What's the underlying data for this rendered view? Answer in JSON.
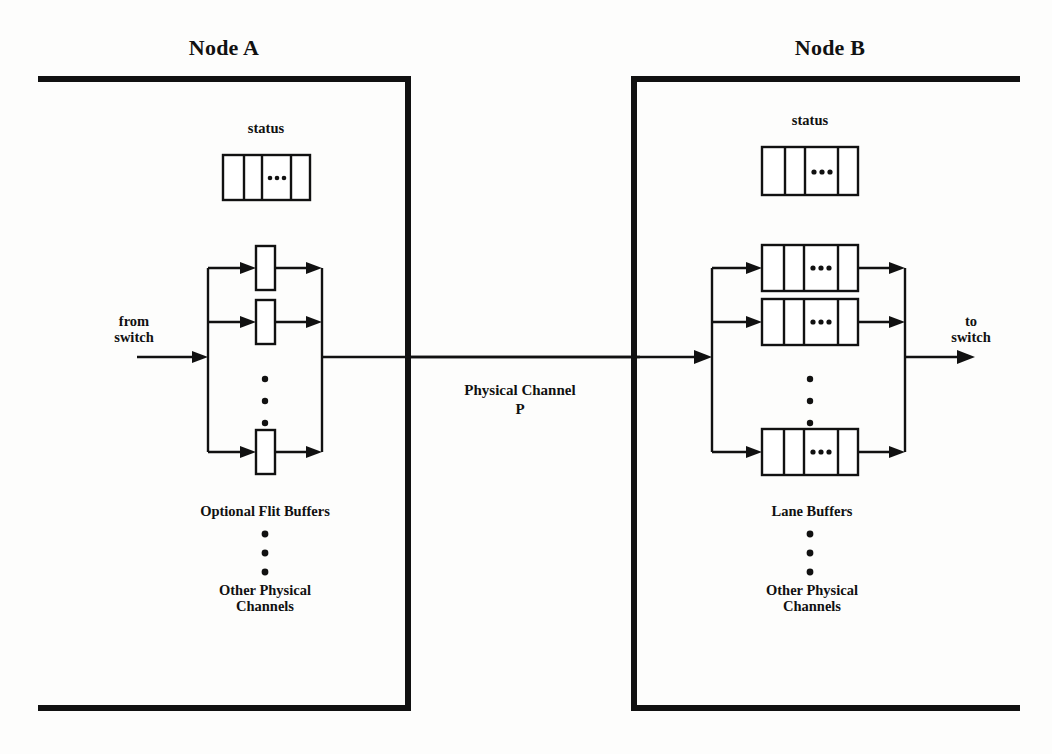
{
  "figure": {
    "type": "diagram"
  },
  "nodes": [
    {
      "id": "node-a",
      "title": "Node A",
      "status_label": "status",
      "status_cells": [
        "",
        "",
        "•••",
        ""
      ],
      "buffers_label": "Optional Flit Buffers",
      "other_label": "Other Physical\nChannels",
      "vertical_ellipsis": "•••",
      "io_label": "from\nswitch",
      "buffer_count_shown": 3
    },
    {
      "id": "node-b",
      "title": "Node B",
      "status_label": "status",
      "status_cells": [
        "",
        "",
        "•••",
        ""
      ],
      "buffers_label": "Lane Buffers",
      "other_label": "Other Physical\nChannels",
      "vertical_ellipsis": "•••",
      "io_label": "to\nswitch",
      "buffer_count_shown": 3,
      "lane_cells": [
        "",
        "",
        "•••",
        ""
      ]
    }
  ],
  "channel": {
    "label_line1": "Physical Channel",
    "label_line2": "P"
  },
  "colors": {
    "ink": "#111111",
    "paper": "#fdfdfc"
  }
}
